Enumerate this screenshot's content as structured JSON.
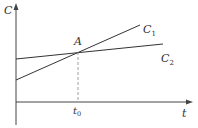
{
  "diagram": {
    "axes": {
      "y_label": "C",
      "x_label": "t"
    },
    "lines": [
      {
        "name": "C1",
        "label": "C",
        "subscript": "1"
      },
      {
        "name": "C2",
        "label": "C",
        "subscript": "2"
      }
    ],
    "intersection": {
      "label": "A"
    },
    "x_marker": {
      "label": "t",
      "subscript": "0"
    },
    "colors": {
      "line": "#333333",
      "dashed": "#888888",
      "background": "#ffffff"
    }
  }
}
